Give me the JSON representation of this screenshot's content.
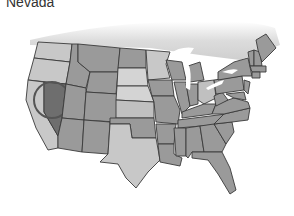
{
  "title": "Nevada",
  "map": {
    "highlighted_state": "Nevada",
    "colors": {
      "light": "#c8c8c8",
      "medium": "#9a9a9a",
      "highlight": "#6e6e6e",
      "canada": "#e2e2e2",
      "lakes": "#ffffff",
      "outline": "#3a3a3a"
    }
  }
}
